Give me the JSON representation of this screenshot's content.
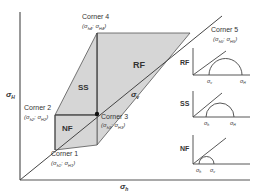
{
  "axes": {
    "y_label": "σ",
    "y_label_sub": "H",
    "x_label": "σ",
    "x_label_sub": "h"
  },
  "diagonal_label": {
    "text": "σ",
    "sub": "v"
  },
  "regions": [
    {
      "id": "RF",
      "label": "RF"
    },
    {
      "id": "SS",
      "label": "SS"
    },
    {
      "id": "NF",
      "label": "NF"
    }
  ],
  "corners": [
    {
      "title": "Corner 1",
      "coords": "(σ",
      "s1": "h1",
      "sep": "; σ",
      "s2": "H1",
      "end": ")"
    },
    {
      "title": "Corner 2",
      "coords": "(σ",
      "s1": "h2",
      "sep": "; σ",
      "s2": "H2",
      "end": ")"
    },
    {
      "title": "Corner 3",
      "coords": "(σ",
      "s1": "h3",
      "sep": "; σ",
      "s2": "H3",
      "end": ")"
    },
    {
      "title": "Corner 4",
      "coords": "(σ",
      "s1": "h4",
      "sep": "; σ",
      "s2": "H4",
      "end": ")"
    },
    {
      "title": "Corner 5",
      "coords": "(σ",
      "s1": "h5",
      "sep": "; σ",
      "s2": "H5",
      "end": ")"
    }
  ],
  "insets": [
    {
      "label": "RF",
      "ticks": [
        {
          "t": "σ",
          "s": "v"
        },
        {
          "t": "σ",
          "s": "H"
        }
      ]
    },
    {
      "label": "SS",
      "ticks": [
        {
          "t": "σ",
          "s": "h"
        },
        {
          "t": "σ",
          "s": "H"
        }
      ]
    },
    {
      "label": "NF",
      "ticks": [
        {
          "t": "σ",
          "s": "h"
        },
        {
          "t": "σ",
          "s": "v"
        }
      ]
    }
  ],
  "colors": {
    "fill": "#d4d4d4",
    "line": "#444444",
    "text": "#333333"
  }
}
